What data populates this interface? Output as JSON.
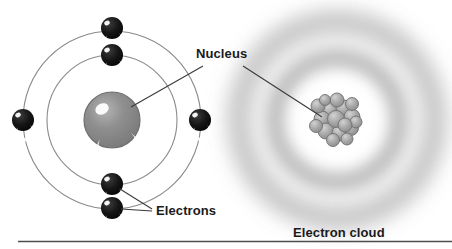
{
  "figure": {
    "title_caption": "",
    "labels": {
      "nucleus": "Nucleus",
      "electrons": "Electrons",
      "electron_cloud": "Electron cloud"
    },
    "colors": {
      "background": "#ffffff",
      "orbit_line": "#8a8a8a",
      "leader_line": "#3a3a3a",
      "electron_fill": "#141414",
      "electron_highlight": "#ffffff",
      "bohr_nucleus_fill": "#8c8c8c",
      "bohr_nucleus_edge": "#6f6f6f",
      "cloud_gray": "#9a9a9a",
      "nucleon_fill": "#a6a6a6",
      "nucleon_edge": "#6b6b6b",
      "rule_line": "#4d4d4d",
      "label_text": "#1a1a1a"
    },
    "bohr_model": {
      "name": "bohr-atom-model",
      "center": {
        "x": 112,
        "y": 120
      },
      "shells": [
        {
          "name": "inner-shell",
          "radius": 65
        },
        {
          "name": "outer-shell",
          "radius": 89
        }
      ],
      "nucleus": {
        "radius": 28,
        "highlight": true
      },
      "electrons": [
        {
          "name": "electron-outer-top",
          "x": 112,
          "y": 28,
          "r": 11,
          "shell": "outer-shell"
        },
        {
          "name": "electron-inner-top",
          "x": 112,
          "y": 55,
          "r": 11,
          "shell": "inner-shell"
        },
        {
          "name": "electron-outer-left",
          "x": 23,
          "y": 120,
          "r": 11,
          "shell": "outer-shell"
        },
        {
          "name": "electron-inner-right",
          "x": 200,
          "y": 120,
          "r": 11,
          "shell": "inner-shell"
        },
        {
          "name": "electron-inner-bottom",
          "x": 112,
          "y": 184,
          "r": 11,
          "shell": "inner-shell"
        },
        {
          "name": "electron-outer-bottom",
          "x": 112,
          "y": 208,
          "r": 11,
          "shell": "outer-shell"
        }
      ]
    },
    "cloud_model": {
      "name": "electron-cloud-model",
      "center": {
        "x": 337,
        "y": 120
      },
      "rings": [
        {
          "name": "cloud-ring-inner",
          "radius": 62,
          "thickness": 20
        },
        {
          "name": "cloud-ring-outer",
          "radius": 98,
          "thickness": 22
        }
      ],
      "nucleus": {
        "radius": 19,
        "nucleon_count": 17
      }
    },
    "leaders": [
      {
        "name": "nucleus-leader-left",
        "from": {
          "x": 203,
          "y": 66
        },
        "to": {
          "x": 131,
          "y": 107
        }
      },
      {
        "name": "nucleus-leader-right",
        "from": {
          "x": 243,
          "y": 66
        },
        "to": {
          "x": 322,
          "y": 117
        }
      },
      {
        "name": "electrons-leader-upper",
        "from": {
          "x": 152,
          "y": 209
        },
        "to": {
          "x": 120,
          "y": 189
        }
      },
      {
        "name": "electrons-leader-lower",
        "from": {
          "x": 152,
          "y": 211
        },
        "to": {
          "x": 121,
          "y": 209
        }
      }
    ],
    "baseline_rule": {
      "name": "bottom-rule",
      "x1": 18,
      "x2": 452,
      "y": 241
    }
  }
}
